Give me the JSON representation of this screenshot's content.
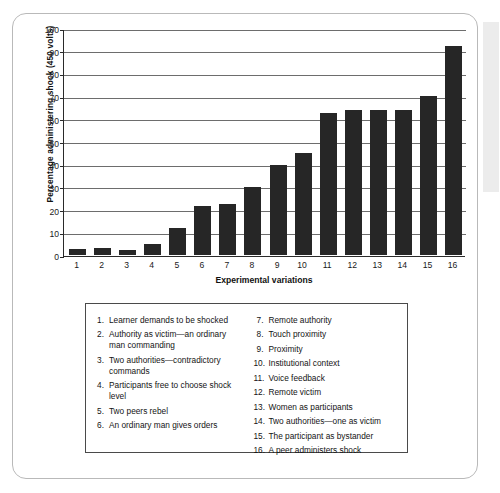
{
  "chart_data": {
    "type": "bar",
    "title": "",
    "xlabel": "Experimental variations",
    "ylabel": "Percentage administering shock (450 volts)",
    "ylim": [
      0,
      100
    ],
    "ytick_step": 10,
    "grid": true,
    "legend_position": "below-chart",
    "bar_color": "#262626",
    "categories": [
      "1",
      "2",
      "3",
      "4",
      "5",
      "6",
      "7",
      "8",
      "9",
      "10",
      "11",
      "12",
      "13",
      "14",
      "15",
      "16"
    ],
    "values": [
      2.5,
      3,
      2,
      5,
      12,
      21.5,
      22.5,
      30,
      40,
      45,
      63,
      64,
      64,
      64,
      70.5,
      92.5
    ],
    "ytick_labels": [
      "100",
      "90",
      "80",
      "70",
      "60",
      "50",
      "40",
      "30",
      "20",
      "10",
      "0"
    ],
    "series": [
      {
        "name": "Percentage administering shock (450 volts)",
        "values": [
          2.5,
          3,
          2,
          5,
          12,
          21.5,
          22.5,
          30,
          40,
          45,
          63,
          64,
          64,
          64,
          70.5,
          92.5
        ]
      }
    ],
    "legend_entries": [
      {
        "num": "1.",
        "label": "Learner demands to be shocked"
      },
      {
        "num": "2.",
        "label": "Authority as victim—an ordinary man commanding"
      },
      {
        "num": "3.",
        "label": "Two authorities—contradictory commands"
      },
      {
        "num": "4.",
        "label": "Participants free to choose shock level"
      },
      {
        "num": "5.",
        "label": "Two peers rebel"
      },
      {
        "num": "6.",
        "label": "An ordinary man gives orders"
      },
      {
        "num": "7.",
        "label": "Remote authority"
      },
      {
        "num": "8.",
        "label": "Touch proximity"
      },
      {
        "num": "9.",
        "label": "Proximity"
      },
      {
        "num": "10.",
        "label": "Institutional context"
      },
      {
        "num": "11.",
        "label": "Voice feedback"
      },
      {
        "num": "12.",
        "label": "Remote victim"
      },
      {
        "num": "13.",
        "label": "Women as participants"
      },
      {
        "num": "14.",
        "label": "Two authorities—one as victim"
      },
      {
        "num": "15.",
        "label": "The participant as bystander"
      },
      {
        "num": "16.",
        "label": "A peer administers shock"
      }
    ]
  }
}
